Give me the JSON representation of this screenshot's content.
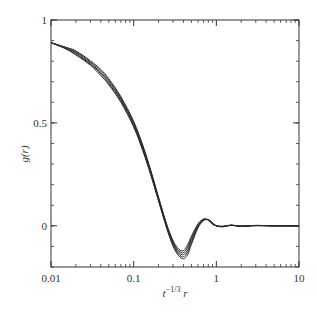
{
  "chart_data": {
    "type": "line",
    "title": "",
    "xlabel": "t^{-1/3} r",
    "xlabel_parts": {
      "base": "t",
      "exp": "−1/3",
      "tail": " r"
    },
    "ylabel": "g(r)",
    "xscale": "log",
    "xlim": [
      0.01,
      10
    ],
    "ylim": [
      -0.2,
      1.0
    ],
    "grid": false,
    "legend": null,
    "x_ticks": [
      {
        "value": 0.01,
        "label": "0.01"
      },
      {
        "value": 0.1,
        "label": "0.1"
      },
      {
        "value": 1,
        "label": "1"
      },
      {
        "value": 10,
        "label": "10"
      }
    ],
    "y_ticks": [
      {
        "value": 0,
        "label": "0"
      },
      {
        "value": 0.5,
        "label": "0.5"
      },
      {
        "value": 1,
        "label": "1"
      }
    ],
    "y_minor_step": 0.1,
    "line_color": "#2a2a2a",
    "x": [
      0.01,
      0.015,
      0.02,
      0.03,
      0.04,
      0.05,
      0.07,
      0.1,
      0.13,
      0.16,
      0.2,
      0.25,
      0.3,
      0.35,
      0.4,
      0.45,
      0.5,
      0.6,
      0.7,
      0.8,
      0.9,
      1.0,
      1.2,
      1.5,
      2.0,
      3.0,
      5.0,
      10.0
    ],
    "series": [
      {
        "name": "curve-1",
        "values": [
          0.89,
          0.86,
          0.83,
          0.78,
          0.73,
          0.685,
          0.6,
          0.48,
          0.36,
          0.25,
          0.12,
          -0.01,
          -0.1,
          -0.145,
          -0.16,
          -0.14,
          -0.09,
          -0.01,
          0.025,
          0.03,
          0.015,
          0.0,
          -0.005,
          0.004,
          -0.003,
          0.002,
          0.0,
          0.0
        ]
      },
      {
        "name": "curve-2",
        "values": [
          0.89,
          0.862,
          0.835,
          0.785,
          0.738,
          0.692,
          0.607,
          0.487,
          0.367,
          0.256,
          0.125,
          -0.005,
          -0.093,
          -0.137,
          -0.15,
          -0.128,
          -0.08,
          -0.005,
          0.027,
          0.03,
          0.013,
          0.0,
          -0.004,
          0.003,
          -0.002,
          0.002,
          0.0,
          0.0
        ]
      },
      {
        "name": "curve-3",
        "values": [
          0.89,
          0.864,
          0.84,
          0.79,
          0.745,
          0.7,
          0.614,
          0.494,
          0.374,
          0.262,
          0.13,
          0.0,
          -0.086,
          -0.129,
          -0.14,
          -0.116,
          -0.07,
          0.0,
          0.029,
          0.029,
          0.011,
          0.0,
          -0.003,
          0.003,
          -0.002,
          0.001,
          0.0,
          0.0
        ]
      },
      {
        "name": "curve-4",
        "values": [
          0.89,
          0.866,
          0.845,
          0.796,
          0.752,
          0.707,
          0.621,
          0.501,
          0.381,
          0.268,
          0.135,
          0.005,
          -0.079,
          -0.121,
          -0.13,
          -0.104,
          -0.06,
          0.005,
          0.031,
          0.028,
          0.009,
          0.0,
          -0.003,
          0.002,
          -0.001,
          0.001,
          0.0,
          0.0
        ]
      },
      {
        "name": "curve-5",
        "values": [
          0.89,
          0.868,
          0.85,
          0.802,
          0.76,
          0.715,
          0.628,
          0.508,
          0.388,
          0.274,
          0.14,
          0.01,
          -0.072,
          -0.113,
          -0.12,
          -0.092,
          -0.05,
          0.01,
          0.033,
          0.027,
          0.007,
          0.0,
          -0.002,
          0.002,
          -0.001,
          0.001,
          0.0,
          0.0
        ]
      }
    ]
  }
}
